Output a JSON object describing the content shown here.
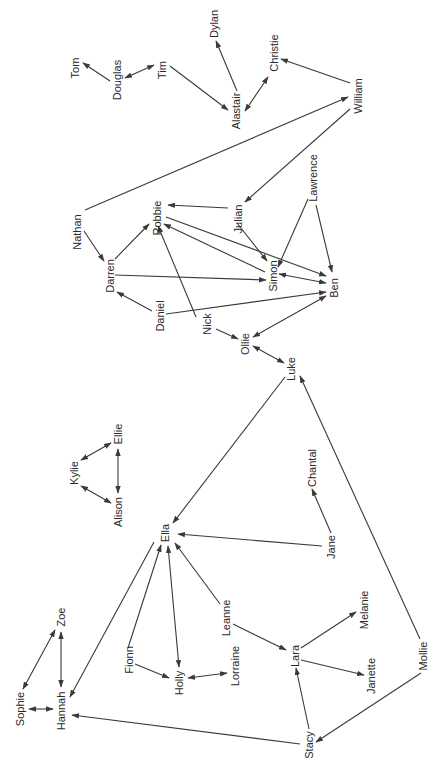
{
  "diagram": {
    "type": "directed-network",
    "orientation": "labels rotated -90deg",
    "colors": {
      "edge": "#3a3a3a",
      "label": "#2a2a2a",
      "background": "#ffffff"
    },
    "nodes": [
      {
        "id": "Tom",
        "label": "Tom",
        "x": 75,
        "y": 68
      },
      {
        "id": "Douglas",
        "label": "Douglas",
        "x": 117,
        "y": 80
      },
      {
        "id": "Tim",
        "label": "Tim",
        "x": 162,
        "y": 70
      },
      {
        "id": "Dylan",
        "label": "Dylan",
        "x": 214,
        "y": 24
      },
      {
        "id": "Alastair",
        "label": "Alastair",
        "x": 236,
        "y": 111
      },
      {
        "id": "Christie",
        "label": "Christie",
        "x": 274,
        "y": 53
      },
      {
        "id": "William",
        "label": "William",
        "x": 358,
        "y": 96
      },
      {
        "id": "Nathan",
        "label": "Nathan",
        "x": 77,
        "y": 232
      },
      {
        "id": "Robbie",
        "label": "Robbie",
        "x": 157,
        "y": 218
      },
      {
        "id": "Julian",
        "label": "Julian",
        "x": 238,
        "y": 219
      },
      {
        "id": "Lawrence",
        "label": "Lawrence",
        "x": 313,
        "y": 178
      },
      {
        "id": "Darren",
        "label": "Darren",
        "x": 110,
        "y": 276
      },
      {
        "id": "Simon",
        "label": "Simon",
        "x": 273,
        "y": 276
      },
      {
        "id": "Ben",
        "label": "Ben",
        "x": 334,
        "y": 288
      },
      {
        "id": "Daniel",
        "label": "Daniel",
        "x": 160,
        "y": 316
      },
      {
        "id": "Nick",
        "label": "Nick",
        "x": 207,
        "y": 324
      },
      {
        "id": "Ollie",
        "label": "Ollie",
        "x": 245,
        "y": 344
      },
      {
        "id": "Luke",
        "label": "Luke",
        "x": 291,
        "y": 369
      },
      {
        "id": "Kylie",
        "label": "Kylie",
        "x": 74,
        "y": 473
      },
      {
        "id": "Ellie",
        "label": "Ellie",
        "x": 118,
        "y": 434
      },
      {
        "id": "Alison",
        "label": "Alison",
        "x": 118,
        "y": 512
      },
      {
        "id": "Chantal",
        "label": "Chantal",
        "x": 312,
        "y": 468
      },
      {
        "id": "Ella",
        "label": "Ella",
        "x": 165,
        "y": 533
      },
      {
        "id": "Jane",
        "label": "Jane",
        "x": 331,
        "y": 547
      },
      {
        "id": "Zoe",
        "label": "Zoe",
        "x": 61,
        "y": 617
      },
      {
        "id": "Sophie",
        "label": "Sophie",
        "x": 20,
        "y": 709
      },
      {
        "id": "Hannah",
        "label": "Hannah",
        "x": 61,
        "y": 711
      },
      {
        "id": "Fionn",
        "label": "Fionn",
        "x": 129,
        "y": 660
      },
      {
        "id": "Holly",
        "label": "Holly",
        "x": 179,
        "y": 683
      },
      {
        "id": "Lorraine",
        "label": "Lorraine",
        "x": 235,
        "y": 666
      },
      {
        "id": "Leanne",
        "label": "Leanne",
        "x": 226,
        "y": 618
      },
      {
        "id": "Lara",
        "label": "Lara",
        "x": 295,
        "y": 656
      },
      {
        "id": "Melanie",
        "label": "Melanie",
        "x": 364,
        "y": 610
      },
      {
        "id": "Janette",
        "label": "Janette",
        "x": 371,
        "y": 676
      },
      {
        "id": "Mollie",
        "label": "Mollie",
        "x": 423,
        "y": 656
      },
      {
        "id": "Stacy",
        "label": "Stacy",
        "x": 309,
        "y": 745
      }
    ],
    "edges": [
      {
        "from": "Douglas",
        "to": "Tom",
        "x1": 110,
        "y1": 81,
        "x2": 83,
        "y2": 63,
        "bidirectional": false
      },
      {
        "from": "Douglas",
        "to": "Tim",
        "x1": 125,
        "y1": 78,
        "x2": 154,
        "y2": 65,
        "bidirectional": true
      },
      {
        "from": "Tim",
        "to": "Alastair",
        "x1": 170,
        "y1": 66,
        "x2": 228,
        "y2": 110,
        "bidirectional": false
      },
      {
        "from": "Alastair",
        "to": "Dylan",
        "x1": 237,
        "y1": 91,
        "x2": 216,
        "y2": 41,
        "bidirectional": false
      },
      {
        "from": "Alastair",
        "to": "Christie",
        "x1": 245,
        "y1": 111,
        "x2": 268,
        "y2": 77,
        "bidirectional": true
      },
      {
        "from": "William",
        "to": "Christie",
        "x1": 350,
        "y1": 83,
        "x2": 281,
        "y2": 59,
        "bidirectional": false
      },
      {
        "from": "Nathan",
        "to": "William",
        "x1": 85,
        "y1": 210,
        "x2": 348,
        "y2": 97,
        "bidirectional": false
      },
      {
        "from": "William",
        "to": "Julian",
        "x1": 350,
        "y1": 109,
        "x2": 245,
        "y2": 202,
        "bidirectional": false
      },
      {
        "from": "Julian",
        "to": "Robbie",
        "x1": 228,
        "y1": 208,
        "x2": 168,
        "y2": 205,
        "bidirectional": false
      },
      {
        "from": "Julian",
        "to": "Simon",
        "x1": 237,
        "y1": 223,
        "x2": 267,
        "y2": 261,
        "bidirectional": false
      },
      {
        "from": "Lawrence",
        "to": "Simon",
        "x1": 308,
        "y1": 199,
        "x2": 278,
        "y2": 267,
        "bidirectional": false
      },
      {
        "from": "Lawrence",
        "to": "Ben",
        "x1": 316,
        "y1": 205,
        "x2": 332,
        "y2": 272,
        "bidirectional": false
      },
      {
        "from": "Nathan",
        "to": "Darren",
        "x1": 84,
        "y1": 231,
        "x2": 104,
        "y2": 261,
        "bidirectional": false
      },
      {
        "from": "Darren",
        "to": "Robbie",
        "x1": 115,
        "y1": 259,
        "x2": 149,
        "y2": 224,
        "bidirectional": false
      },
      {
        "from": "Darren",
        "to": "Simon",
        "x1": 115,
        "y1": 275,
        "x2": 266,
        "y2": 280,
        "bidirectional": false
      },
      {
        "from": "Robbie",
        "to": "Ben",
        "x1": 166,
        "y1": 217,
        "x2": 326,
        "y2": 276,
        "bidirectional": false
      },
      {
        "from": "Simon",
        "to": "Robbie",
        "x1": 265,
        "y1": 272,
        "x2": 164,
        "y2": 224,
        "bidirectional": false
      },
      {
        "from": "Simon",
        "to": "Ben",
        "x1": 279,
        "y1": 274,
        "x2": 326,
        "y2": 283,
        "bidirectional": true
      },
      {
        "from": "Daniel",
        "to": "Darren",
        "x1": 152,
        "y1": 311,
        "x2": 117,
        "y2": 292,
        "bidirectional": false
      },
      {
        "from": "Daniel",
        "to": "Ben",
        "x1": 166,
        "y1": 314,
        "x2": 326,
        "y2": 292,
        "bidirectional": false
      },
      {
        "from": "Nick",
        "to": "Robbie",
        "x1": 196,
        "y1": 317,
        "x2": 158,
        "y2": 226,
        "bidirectional": false
      },
      {
        "from": "Nick",
        "to": "Ollie",
        "x1": 216,
        "y1": 329,
        "x2": 238,
        "y2": 339,
        "bidirectional": false
      },
      {
        "from": "Ollie",
        "to": "Ben",
        "x1": 253,
        "y1": 337,
        "x2": 326,
        "y2": 296,
        "bidirectional": true
      },
      {
        "from": "Ollie",
        "to": "Luke",
        "x1": 253,
        "y1": 346,
        "x2": 284,
        "y2": 363,
        "bidirectional": true
      },
      {
        "from": "Luke",
        "to": "Ella",
        "x1": 285,
        "y1": 377,
        "x2": 173,
        "y2": 523,
        "bidirectional": false
      },
      {
        "from": "Mollie",
        "to": "Luke",
        "x1": 420,
        "y1": 639,
        "x2": 300,
        "y2": 376,
        "bidirectional": false
      },
      {
        "from": "Kylie",
        "to": "Ellie",
        "x1": 81,
        "y1": 460,
        "x2": 111,
        "y2": 443,
        "bidirectional": true
      },
      {
        "from": "Kylie",
        "to": "Alison",
        "x1": 81,
        "y1": 486,
        "x2": 111,
        "y2": 503,
        "bidirectional": true
      },
      {
        "from": "Ellie",
        "to": "Alison",
        "x1": 118,
        "y1": 449,
        "x2": 118,
        "y2": 493,
        "bidirectional": true
      },
      {
        "from": "Jane",
        "to": "Chantal",
        "x1": 331,
        "y1": 533,
        "x2": 312,
        "y2": 489,
        "bidirectional": false
      },
      {
        "from": "Jane",
        "to": "Ella",
        "x1": 322,
        "y1": 546,
        "x2": 178,
        "y2": 534,
        "bidirectional": false
      },
      {
        "from": "Ella",
        "to": "Hannah",
        "x1": 154,
        "y1": 542,
        "x2": 70,
        "y2": 697,
        "bidirectional": false
      },
      {
        "from": "Fionn",
        "to": "Ella",
        "x1": 128,
        "y1": 648,
        "x2": 161,
        "y2": 545,
        "bidirectional": false
      },
      {
        "from": "Ella",
        "to": "Holly",
        "x1": 168,
        "y1": 546,
        "x2": 179,
        "y2": 667,
        "bidirectional": true
      },
      {
        "from": "Leanne",
        "to": "Ella",
        "x1": 220,
        "y1": 604,
        "x2": 175,
        "y2": 543,
        "bidirectional": false
      },
      {
        "from": "Fionn",
        "to": "Holly",
        "x1": 135,
        "y1": 664,
        "x2": 169,
        "y2": 678,
        "bidirectional": false
      },
      {
        "from": "Holly",
        "to": "Lorraine",
        "x1": 188,
        "y1": 678,
        "x2": 227,
        "y2": 673,
        "bidirectional": true
      },
      {
        "from": "Leanne",
        "to": "Lara",
        "x1": 233,
        "y1": 624,
        "x2": 286,
        "y2": 650,
        "bidirectional": false
      },
      {
        "from": "Lara",
        "to": "Melanie",
        "x1": 301,
        "y1": 648,
        "x2": 356,
        "y2": 612,
        "bidirectional": false
      },
      {
        "from": "Lara",
        "to": "Janette",
        "x1": 301,
        "y1": 660,
        "x2": 364,
        "y2": 675,
        "bidirectional": false
      },
      {
        "from": "Stacy",
        "to": "Lara",
        "x1": 309,
        "y1": 729,
        "x2": 296,
        "y2": 668,
        "bidirectional": false
      },
      {
        "from": "Mollie",
        "to": "Stacy",
        "x1": 421,
        "y1": 673,
        "x2": 316,
        "y2": 742,
        "bidirectional": false
      },
      {
        "from": "Stacy",
        "to": "Hannah",
        "x1": 300,
        "y1": 744,
        "x2": 72,
        "y2": 715,
        "bidirectional": false
      },
      {
        "from": "Zoe",
        "to": "Sophie",
        "x1": 55,
        "y1": 630,
        "x2": 23,
        "y2": 689,
        "bidirectional": true
      },
      {
        "from": "Zoe",
        "to": "Hannah",
        "x1": 61,
        "y1": 632,
        "x2": 61,
        "y2": 687,
        "bidirectional": true
      },
      {
        "from": "Sophie",
        "to": "Hannah",
        "x1": 29,
        "y1": 709,
        "x2": 53,
        "y2": 709,
        "bidirectional": true
      }
    ]
  }
}
